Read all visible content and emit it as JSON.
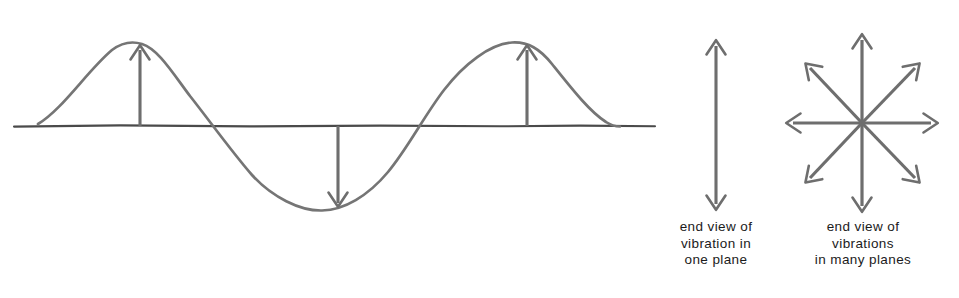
{
  "figure": {
    "background_color": "#ffffff",
    "stroke_color": "#6e6e6e",
    "baseline_color": "#4a4a4a",
    "text_color": "#1b1b1b"
  },
  "wave_panel": {
    "name": "transverse wave with displacement arrows",
    "baseline": {
      "x1": 14,
      "x2": 655,
      "y": 126
    },
    "wave": {
      "x_start": 38,
      "x_end": 620,
      "amplitude": 83,
      "period": 390,
      "crest_1_x": 140,
      "crest_2_x": 527,
      "trough_x": 338,
      "crest_y": 43,
      "trough_y": 209
    },
    "arrows": [
      {
        "label": "displacement-up-first-crest",
        "x": 140,
        "direction": "up"
      },
      {
        "label": "displacement-down-trough",
        "x": 338,
        "direction": "down"
      },
      {
        "label": "displacement-up-second-crest",
        "x": 527,
        "direction": "up"
      }
    ]
  },
  "single_plane_panel": {
    "name": "end view of vibration in one plane",
    "arrow": {
      "x": 716,
      "y_top": 40,
      "y_bottom": 210,
      "heads": "double"
    },
    "caption": {
      "lines": [
        "end view of",
        "vibration in",
        "one plane"
      ],
      "line1": "end view of",
      "line2": "vibration in",
      "line3": "one plane"
    }
  },
  "many_planes_panel": {
    "name": "end view of vibrations in many planes",
    "starburst": {
      "center_x": 862,
      "center_y": 123,
      "arrow_count": 8,
      "radius_horizontal": 76,
      "radius_vertical": 90,
      "radius_diagonal": 80,
      "directions": [
        "up",
        "up-right",
        "right",
        "down-right",
        "down",
        "down-left",
        "left",
        "up-left"
      ]
    },
    "caption": {
      "lines": [
        "end view of",
        "vibrations",
        "in many planes"
      ],
      "line1": "end view of",
      "line2": "vibrations",
      "line3": "in many planes"
    }
  }
}
